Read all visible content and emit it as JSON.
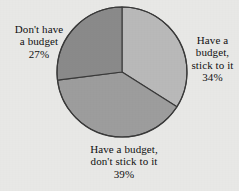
{
  "background_color": "#e8e8e6",
  "chart_data": {
    "type": "pie",
    "title": "",
    "subtitle": "",
    "xlabel": "",
    "ylabel": "",
    "legend_position": "none",
    "grid": false,
    "start_angle_deg": 0,
    "direction": "clockwise",
    "center": {
      "x": 122,
      "y": 72
    },
    "radius": 65,
    "outline_color": "#3a3a3a",
    "categories": [
      "Have a budget, stick to it",
      "Have a budget, don't stick to it",
      "Don't have a budget"
    ],
    "values": [
      34,
      39,
      27
    ],
    "value_labels": [
      "34%",
      "39%",
      "27%"
    ],
    "units": "percent",
    "slices": [
      {
        "name": "Have a budget, stick to it",
        "value": 34,
        "value_label": "34%",
        "color": "#b9b9b9",
        "label_lines": "Have a\nbudget,\nstick to it\n34%",
        "label_position": "right"
      },
      {
        "name": "Have a budget, don't stick to it",
        "value": 39,
        "value_label": "39%",
        "color": "#9d9d9d",
        "label_lines": "Have a budget,\ndon't stick to it\n39%",
        "label_position": "bottom"
      },
      {
        "name": "Don't have a budget",
        "value": 27,
        "value_label": "27%",
        "color": "#8a8a8a",
        "label_lines": "Don't have\na budget\n27%",
        "label_position": "left"
      }
    ]
  }
}
